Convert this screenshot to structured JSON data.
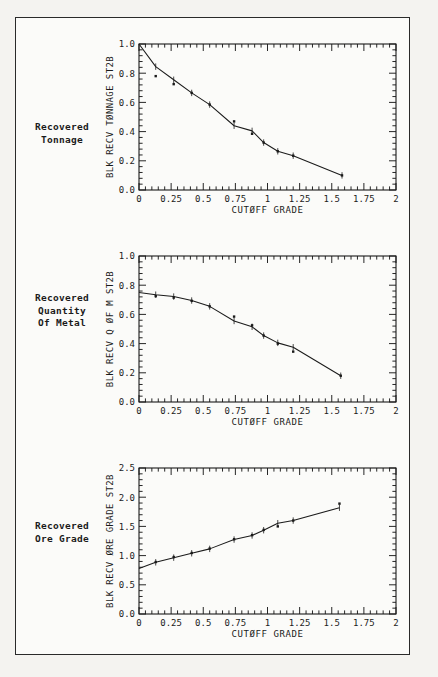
{
  "figure": {
    "background_color": "#f4f3f0",
    "border_color": "#2a2a2a",
    "ink_color": "#1b1b1b",
    "caption": ""
  },
  "panels": [
    {
      "id": "recovered-tonnage",
      "label_lines": [
        "Recovered",
        "Tonnage"
      ],
      "chart_data": {
        "type": "scatter",
        "title": "",
        "xlabel": "CUTØFF GRADE",
        "ylabel": "BLK RECV TØNNAGE ST2B",
        "xlim": [
          0,
          2
        ],
        "ylim": [
          0,
          1.0
        ],
        "xticks": [
          0,
          0.25,
          0.5,
          0.75,
          1,
          1.25,
          1.5,
          1.75,
          2
        ],
        "xticklabels": [
          "0",
          "0.25",
          "0.5",
          "0.75",
          "1",
          "1.25",
          "1.5",
          "1.75",
          "2"
        ],
        "yticks": [
          0.0,
          0.2,
          0.4,
          0.6,
          0.8,
          1.0
        ],
        "yticklabels": [
          "0.0",
          "0.2",
          "0.4",
          "0.6",
          "0.8",
          "1.0"
        ],
        "grid": false,
        "legend": "none",
        "series": [
          {
            "name": "fitted curve",
            "style": "line",
            "x": [
              0.0,
              0.13,
              0.27,
              0.41,
              0.55,
              0.74,
              0.88,
              0.97,
              1.08,
              1.2,
              1.58
            ],
            "y": [
              1.0,
              0.845,
              0.755,
              0.665,
              0.585,
              0.44,
              0.405,
              0.325,
              0.265,
              0.235,
              0.1
            ]
          },
          {
            "name": "observed points",
            "style": "points",
            "x": [
              0.13,
              0.27,
              0.41,
              0.55,
              0.74,
              0.88,
              0.97,
              1.08,
              1.2,
              1.58
            ],
            "y": [
              0.78,
              0.725,
              0.665,
              0.585,
              0.47,
              0.385,
              0.325,
              0.265,
              0.235,
              0.1
            ]
          }
        ]
      }
    },
    {
      "id": "recovered-quantity-of-metal",
      "label_lines": [
        "Recovered",
        "Quantity",
        "Of Metal"
      ],
      "chart_data": {
        "type": "scatter",
        "title": "",
        "xlabel": "CUTØFF GRADE",
        "ylabel": "BLK RECV Q ØF M ST2B",
        "xlim": [
          0,
          2
        ],
        "ylim": [
          0,
          1.0
        ],
        "xticks": [
          0,
          0.25,
          0.5,
          0.75,
          1,
          1.25,
          1.5,
          1.75,
          2
        ],
        "xticklabels": [
          "0",
          "0.25",
          "0.5",
          "0.75",
          "1",
          "1.25",
          "1.5",
          "1.75",
          "2"
        ],
        "yticks": [
          0.0,
          0.2,
          0.4,
          0.6,
          0.8,
          1.0
        ],
        "yticklabels": [
          "0.0",
          "0.2",
          "0.4",
          "0.6",
          "0.8",
          "1.0"
        ],
        "grid": false,
        "legend": "none",
        "series": [
          {
            "name": "fitted curve",
            "style": "line",
            "x": [
              0.0,
              0.13,
              0.27,
              0.41,
              0.55,
              0.74,
              0.88,
              0.97,
              1.08,
              1.2,
              1.57
            ],
            "y": [
              0.75,
              0.735,
              0.722,
              0.695,
              0.655,
              0.555,
              0.515,
              0.455,
              0.405,
              0.375,
              0.18
            ]
          },
          {
            "name": "observed points",
            "style": "points",
            "x": [
              0.13,
              0.27,
              0.41,
              0.55,
              0.74,
              0.88,
              0.97,
              1.08,
              1.2,
              1.57
            ],
            "y": [
              0.725,
              0.715,
              0.693,
              0.655,
              0.585,
              0.525,
              0.455,
              0.4,
              0.345,
              0.18
            ]
          }
        ]
      }
    },
    {
      "id": "recovered-ore-grade",
      "label_lines": [
        "Recovered",
        "Ore Grade"
      ],
      "chart_data": {
        "type": "scatter",
        "title": "",
        "xlabel": "CUTØFF GRADE",
        "ylabel": "BLK RECV ØRE GRADE ST2B",
        "xlim": [
          0,
          2
        ],
        "ylim": [
          0,
          2.5
        ],
        "xticks": [
          0,
          0.25,
          0.5,
          0.75,
          1,
          1.25,
          1.5,
          1.75,
          2
        ],
        "xticklabels": [
          "0",
          "0.25",
          "0.5",
          "0.75",
          "1",
          "1.25",
          "1.5",
          "1.75",
          "2"
        ],
        "yticks": [
          0.0,
          0.5,
          1.0,
          1.5,
          2.0,
          2.5
        ],
        "yticklabels": [
          "0.0",
          "0.5",
          "1.0",
          "1.5",
          "2.0",
          "2.5"
        ],
        "grid": false,
        "legend": "none",
        "series": [
          {
            "name": "fitted curve",
            "style": "line",
            "x": [
              0.0,
              0.13,
              0.27,
              0.41,
              0.55,
              0.74,
              0.88,
              0.97,
              1.08,
              1.2,
              1.56
            ],
            "y": [
              0.78,
              0.885,
              0.965,
              1.04,
              1.115,
              1.275,
              1.345,
              1.435,
              1.555,
              1.6,
              1.82
            ]
          },
          {
            "name": "observed points",
            "style": "points",
            "x": [
              0.13,
              0.27,
              0.41,
              0.55,
              0.74,
              0.88,
              0.97,
              1.08,
              1.2,
              1.56
            ],
            "y": [
              0.89,
              0.975,
              1.045,
              1.12,
              1.28,
              1.35,
              1.44,
              1.5,
              1.6,
              1.89
            ]
          }
        ]
      }
    }
  ]
}
